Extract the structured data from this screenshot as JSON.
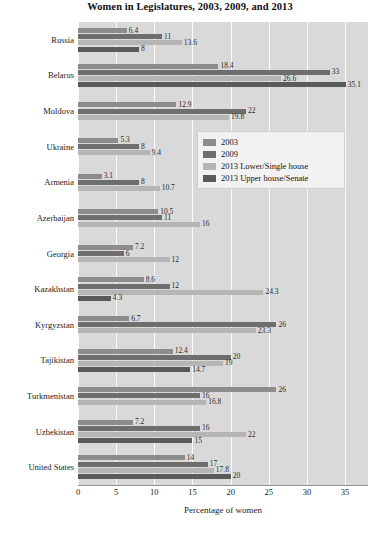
{
  "chart_data": {
    "type": "bar",
    "orientation": "horizontal",
    "title": "Women in Legislatures, 2003, 2009, and 2013",
    "xlabel": "Percentage of women",
    "ylabel": "",
    "xlim": [
      0,
      38
    ],
    "xticks": [
      0,
      5,
      10,
      15,
      20,
      25,
      30,
      35
    ],
    "grid": "vertical",
    "legend_position": "upper-right-inside",
    "categories": [
      "Russia",
      "Belarus",
      "Moldova",
      "Ukraine",
      "Armenia",
      "Azerbaijan",
      "Georgia",
      "Kazakhstan",
      "Kyrgyzstan",
      "Tajikistan",
      "Turkmenistan",
      "Uzbekistan",
      "United States"
    ],
    "series": [
      {
        "name": "2003",
        "color": "#8c8c8c",
        "values": [
          6.4,
          18.4,
          12.9,
          5.3,
          3.1,
          10.5,
          7.2,
          8.6,
          6.7,
          12.4,
          26,
          7.2,
          14
        ]
      },
      {
        "name": "2009",
        "color": "#6e6e6e",
        "values": [
          11,
          33,
          22,
          8,
          8,
          11,
          6,
          12,
          26,
          20,
          16,
          16,
          17
        ]
      },
      {
        "name": "2013 Lower/Single house",
        "color": "#b5b5b5",
        "values": [
          13.6,
          26.6,
          19.8,
          9.4,
          10.7,
          16,
          12,
          24.3,
          23.3,
          19,
          16.8,
          22,
          17.8
        ]
      },
      {
        "name": "2013 Upper house/Senate",
        "color": "#5a5a5a",
        "values": [
          8,
          35.1,
          null,
          null,
          null,
          null,
          null,
          4.3,
          null,
          14.7,
          null,
          15,
          20
        ]
      }
    ]
  },
  "legend": {
    "items": [
      {
        "label": "2003"
      },
      {
        "label": "2009"
      },
      {
        "label": "2013 Lower/Single house"
      },
      {
        "label": "2013 Upper house/Senate"
      }
    ]
  }
}
